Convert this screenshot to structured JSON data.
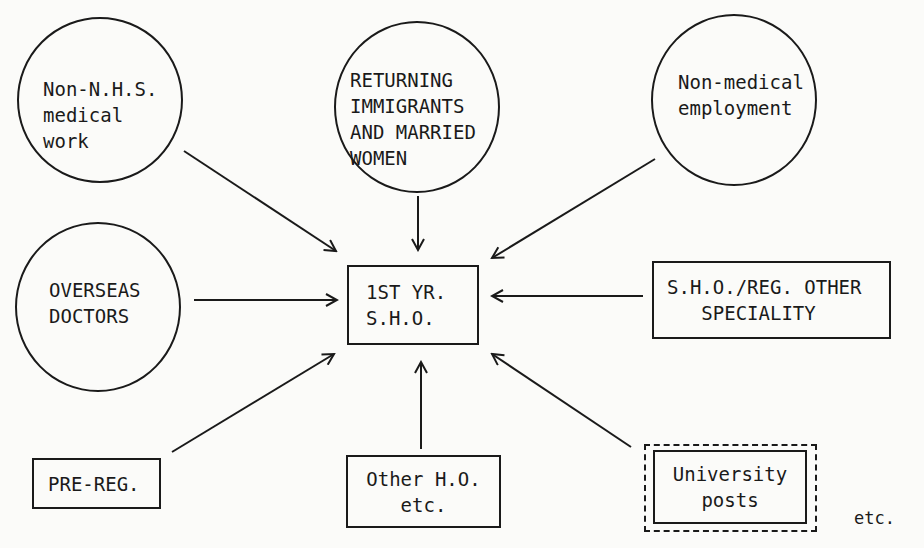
{
  "diagram": {
    "center": {
      "lines": [
        "1ST YR.",
        "S.H.O."
      ]
    },
    "sources": {
      "non_nhs": {
        "shape": "circle",
        "lines": [
          "Non-N.H.S.",
          "medical",
          "work"
        ]
      },
      "returning": {
        "shape": "circle",
        "lines": [
          "RETURNING",
          "IMMIGRANTS",
          "AND MARRIED",
          "WOMEN"
        ]
      },
      "non_medical": {
        "shape": "circle",
        "lines": [
          "Non-medical",
          "employment"
        ]
      },
      "overseas": {
        "shape": "circle",
        "lines": [
          "OVERSEAS",
          "DOCTORS"
        ]
      },
      "sho_reg": {
        "shape": "box",
        "lines": [
          "S.H.O./REG. OTHER",
          "   SPECIALITY"
        ]
      },
      "pre_reg": {
        "shape": "box",
        "lines": [
          "PRE-REG."
        ]
      },
      "other_ho": {
        "shape": "box",
        "lines": [
          "Other H.O.",
          "etc."
        ]
      },
      "university": {
        "shape": "double-dashed-box",
        "lines": [
          "University",
          "posts"
        ]
      }
    },
    "edges": [
      {
        "from": "non_nhs",
        "to": "center"
      },
      {
        "from": "returning",
        "to": "center"
      },
      {
        "from": "non_medical",
        "to": "center"
      },
      {
        "from": "overseas",
        "to": "center"
      },
      {
        "from": "sho_reg",
        "to": "center"
      },
      {
        "from": "pre_reg",
        "to": "center"
      },
      {
        "from": "other_ho",
        "to": "center"
      },
      {
        "from": "university",
        "to": "center"
      }
    ],
    "footnote": "etc.",
    "colors": {
      "ink": "#1a1a1a",
      "paper": "#fbfbf9"
    }
  }
}
